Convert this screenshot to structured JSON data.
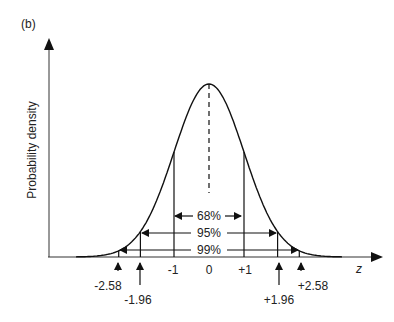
{
  "panel_label": "(b)",
  "chart_data": {
    "type": "line",
    "title": "",
    "panel_label": "(b)",
    "xlabel": "z",
    "ylabel": "Probability density",
    "x_range": [
      -3.8,
      3.8
    ],
    "mean": 0,
    "sd": 1,
    "tick_labels": [
      "-1",
      "0",
      "+1"
    ],
    "ticks": [
      -1,
      0,
      1
    ],
    "critical_values": [
      {
        "value": -2.58,
        "label": "-2.58"
      },
      {
        "value": -1.96,
        "label": "-1.96"
      },
      {
        "value": 1.96,
        "label": "+1.96"
      },
      {
        "value": 2.58,
        "label": "+2.58"
      }
    ],
    "intervals": [
      {
        "label": "68%",
        "from": -1,
        "to": 1
      },
      {
        "label": "95%",
        "from": -1.96,
        "to": 1.96
      },
      {
        "label": "99%",
        "from": -2.58,
        "to": 2.58
      }
    ],
    "grid": false,
    "legend": null
  },
  "labels": {
    "xlabel": "z",
    "ylabel": "Probability density",
    "tick_m1": "-1",
    "tick_0": "0",
    "tick_p1": "+1",
    "cv_m258": "-2.58",
    "cv_m196": "-1.96",
    "cv_p196": "+1.96",
    "cv_p258": "+2.58",
    "int68": "68%",
    "int95": "95%",
    "int99": "99%"
  }
}
